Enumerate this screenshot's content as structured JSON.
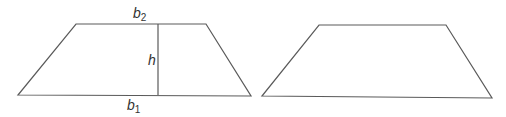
{
  "diagram": {
    "stroke_color": "#5a5a5a",
    "label_color": "#333333",
    "background": "#ffffff",
    "shapes": [
      {
        "id": "trapezoid-labeled",
        "vertices": [
          [
            76,
            24
          ],
          [
            206,
            24
          ],
          [
            251,
            96
          ],
          [
            18,
            95
          ]
        ],
        "height_line": {
          "x": 158,
          "y1": 24,
          "y2": 95
        },
        "labels": {
          "top_base": {
            "base": "b",
            "sub": "2",
            "x": 133,
            "y": 18
          },
          "bottom_base": {
            "base": "b",
            "sub": "1",
            "x": 127,
            "y": 110
          },
          "height": {
            "text": "h",
            "x": 148,
            "y": 65
          }
        }
      },
      {
        "id": "trapezoid-plain",
        "vertices": [
          [
            319,
            25
          ],
          [
            446,
            25
          ],
          [
            492,
            98
          ],
          [
            262,
            96
          ]
        ]
      }
    ]
  }
}
